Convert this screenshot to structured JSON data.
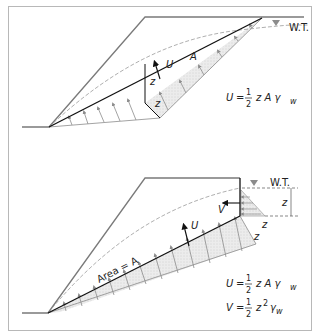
{
  "figure": {
    "top_panel": {
      "water_table_label": "W.T.",
      "area_label": "A",
      "force_label": "U",
      "crack_depth_label": "z",
      "pressure_depth_label": "z",
      "equation": {
        "lhs": "U",
        "eq": "=",
        "num": "1",
        "den": "2",
        "rhs": "z A γ",
        "sub": "w"
      }
    },
    "bottom_panel": {
      "water_table_label": "W.T.",
      "area_label": "Area = A",
      "force_u_label": "U",
      "force_v_label": "V",
      "crack_depth_label": "z",
      "pressure_width_label": "z",
      "pressure_depth_label": "z",
      "equation_u": {
        "lhs": "U",
        "eq": "=",
        "num": "1",
        "den": "2",
        "rhs": "z A γ",
        "sub": "w"
      },
      "equation_v": {
        "lhs": "V",
        "eq": "=",
        "num": "1",
        "den": "2",
        "rhs": "z",
        "sup": "2",
        "rhs2": "γ",
        "sub": "w"
      }
    },
    "colors": {
      "slope_line": "#7a7a7a",
      "failure_plane": "#111111",
      "water_table": "#9a9a9a",
      "pressure_fill": "#e6e6e6",
      "arrow_gray": "#8c8c8c",
      "frame": "#b8b8b8"
    }
  }
}
